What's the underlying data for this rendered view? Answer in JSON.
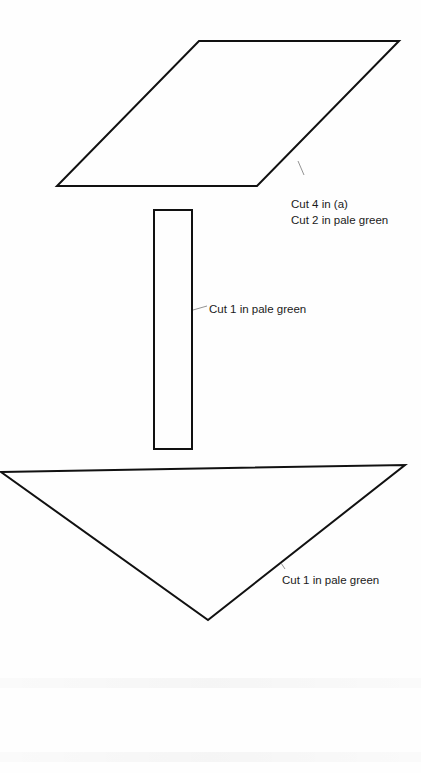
{
  "diagram": {
    "title": "",
    "stroke_color": "#111111",
    "leader_color": "#777777",
    "pieces": [
      {
        "id": "parallelogram",
        "shape": "parallelogram",
        "points": [
          [
            199,
            41
          ],
          [
            399,
            41
          ],
          [
            257,
            186
          ],
          [
            57,
            186
          ]
        ],
        "label_lines": [
          "Cut 4 in (a)",
          "Cut 2 in pale green"
        ],
        "label_pos": [
          291,
          196
        ],
        "leader": [
          [
            298,
            161
          ],
          [
            304,
            175
          ]
        ]
      },
      {
        "id": "strip",
        "shape": "rectangle",
        "points": [
          [
            154,
            210
          ],
          [
            192,
            210
          ],
          [
            192,
            449
          ],
          [
            154,
            449
          ]
        ],
        "label_lines": [
          "Cut 1 in pale green"
        ],
        "label_pos": [
          209,
          301
        ],
        "leader": [
          [
            193,
            310
          ],
          [
            207,
            306
          ]
        ]
      },
      {
        "id": "triangle",
        "shape": "triangle",
        "points": [
          [
            1,
            472
          ],
          [
            405,
            465
          ],
          [
            208,
            620
          ]
        ],
        "label_lines": [
          "Cut 1 in pale green"
        ],
        "label_pos": [
          282,
          572
        ],
        "leader": [
          [
            281,
            563
          ],
          [
            285,
            569
          ]
        ]
      }
    ]
  }
}
